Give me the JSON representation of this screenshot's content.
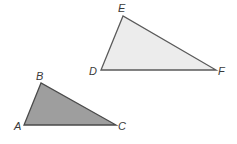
{
  "diagram": {
    "type": "geometry-similar-triangles",
    "triangles": [
      {
        "name": "DEF",
        "fill": "#ececec",
        "stroke": "#5a5a5a",
        "vertices": {
          "E": {
            "x": 123,
            "y": 16,
            "label": "E",
            "lx": 118,
            "ly": 12
          },
          "D": {
            "x": 101,
            "y": 70,
            "label": "D",
            "lx": 89,
            "ly": 75
          },
          "F": {
            "x": 216,
            "y": 70,
            "label": "F",
            "lx": 218,
            "ly": 75
          }
        }
      },
      {
        "name": "ABC",
        "fill": "#9e9e9e",
        "stroke": "#4a4a4a",
        "vertices": {
          "B": {
            "x": 41,
            "y": 83,
            "label": "B",
            "lx": 36,
            "ly": 80
          },
          "A": {
            "x": 24,
            "y": 125,
            "label": "A",
            "lx": 14,
            "ly": 130
          },
          "C": {
            "x": 116,
            "y": 125,
            "label": "C",
            "lx": 118,
            "ly": 130
          }
        }
      }
    ]
  }
}
